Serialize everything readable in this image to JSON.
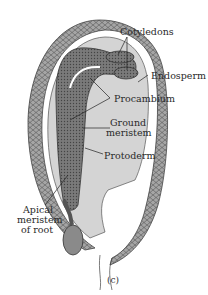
{
  "figure": {
    "caption": "(c)",
    "labels": {
      "cotyledons": "Cotyledons",
      "endosperm": "Endosperm",
      "procambium": "Procambium",
      "ground_meristem_line1": "Ground",
      "ground_meristem_line2": "meristem",
      "protoderm": "Protoderm",
      "apical_line1": "Apical",
      "apical_line2": "meristem",
      "apical_line3": "of root"
    },
    "colors": {
      "seed_coat": "#9a9a9a",
      "endosperm": "#d4d4d4",
      "embryo": "#6e6e6e",
      "root_cap": "#8a8a8a",
      "outline": "#333333"
    }
  }
}
